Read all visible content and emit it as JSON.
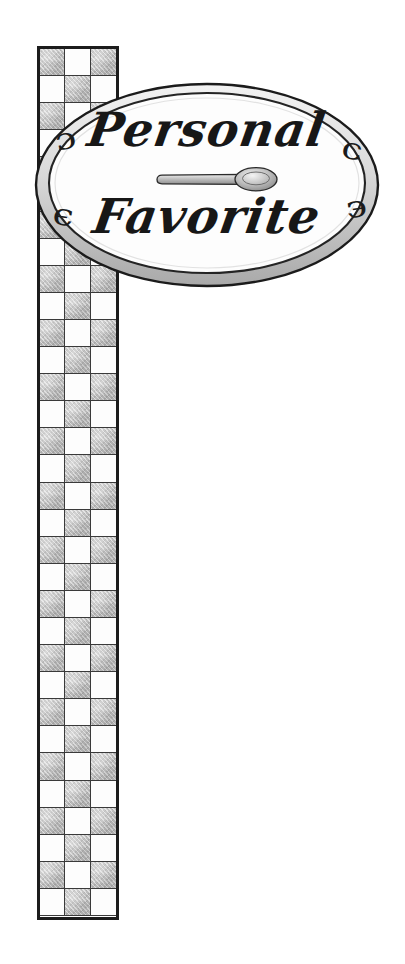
{
  "artwork": {
    "title": "Personal Favorite",
    "medium_note": "hand-drawn pencil and ink illustration",
    "background_color": "#ffffff"
  },
  "sign": {
    "shape": "oval",
    "line_1": "Personal",
    "line_2": "Favorite",
    "border_color": "#1a1a1a",
    "fill_color": "#fdfdfd",
    "shading_color": "#c9c9c9",
    "flourishes": {
      "top_left": "ɔ",
      "bottom_left": "є",
      "top_right": "ɔ",
      "bottom_right": "є"
    },
    "icon": {
      "name": "spoon-icon",
      "label": "spoon",
      "bowl_side": "right",
      "color": "#8f8f8f"
    }
  },
  "column": {
    "pattern": "checkerboard",
    "columns": 3,
    "rows": 32,
    "light_color": "#fdfdfd",
    "dark_color": "#bcbcbc",
    "border_color": "#1c1c1c",
    "grid_line_color": "#3a3a3a",
    "first_cell": "dark"
  }
}
